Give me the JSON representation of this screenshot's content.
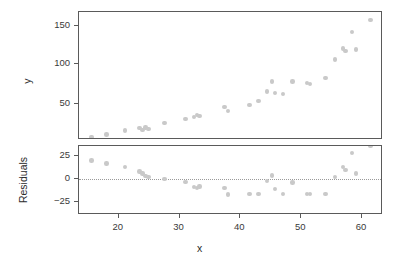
{
  "chart_data": [
    {
      "type": "scatter",
      "panel": "top",
      "title": "",
      "xlabel": "x",
      "ylabel": "y",
      "xlim": [
        14.0,
        63.5
      ],
      "ylim": [
        0,
        168
      ],
      "xticks": [
        20,
        30,
        40,
        50,
        60
      ],
      "xticklabels": [
        "20",
        "30",
        "40",
        "50",
        "60"
      ],
      "yticks": [
        50,
        100,
        150
      ],
      "yticklabels": [
        "50",
        "100",
        "150"
      ],
      "grid": false,
      "legend": null,
      "marker": "filled-circle",
      "marker_color": "#c9c9c9",
      "x": [
        15.5,
        18.0,
        21.0,
        23.4,
        23.9,
        24.4,
        24.9,
        27.5,
        31.0,
        32.4,
        32.9,
        33.3,
        37.4,
        38.0,
        41.5,
        43.0,
        44.4,
        45.2,
        45.7,
        47.0,
        48.6,
        51.0,
        51.4,
        54.0,
        55.6,
        56.9,
        57.3,
        58.4,
        59.0,
        61.4
      ],
      "y": [
        8,
        11,
        16,
        19,
        17,
        20,
        18,
        26,
        31,
        33,
        36,
        35,
        46,
        41,
        49,
        54,
        66,
        79,
        64,
        63,
        79,
        77,
        76,
        83,
        107,
        121,
        118,
        142,
        120,
        158
      ]
    },
    {
      "type": "scatter",
      "panel": "residuals",
      "title": "",
      "xlabel": "x",
      "ylabel": "Residuals",
      "xlim": [
        14.0,
        63.5
      ],
      "ylim": [
        -32,
        40
      ],
      "xticks": [
        20,
        30,
        40,
        50,
        60
      ],
      "xticklabels": [
        "20",
        "30",
        "40",
        "50",
        "60"
      ],
      "yticks": [
        25,
        0,
        -25
      ],
      "yticklabels": [
        "25",
        "0",
        "−25"
      ],
      "grid": false,
      "reference_line": {
        "y": 0,
        "style": "dotted",
        "color": "#9a9a9a"
      },
      "legend": null,
      "marker": "filled-circle",
      "marker_color": "#c9c9c9",
      "x": [
        15.5,
        18.0,
        21.0,
        23.4,
        23.9,
        24.4,
        24.9,
        27.5,
        31.0,
        32.4,
        32.9,
        33.3,
        37.4,
        38.0,
        41.5,
        43.0,
        44.4,
        45.2,
        45.7,
        47.0,
        48.6,
        51.0,
        51.4,
        54.0,
        55.6,
        56.9,
        57.3,
        58.4,
        59.0,
        61.4
      ],
      "y": [
        20,
        17,
        13,
        8,
        6,
        3,
        2,
        0,
        -3,
        -9,
        -10,
        -8,
        -10,
        -17,
        -16,
        -16,
        -2,
        4,
        -11,
        -16,
        -4,
        -16,
        -16,
        -16,
        2,
        13,
        10,
        28,
        6,
        36
      ]
    }
  ],
  "axes": {
    "top": {
      "ylabel": "y",
      "yticklabels": [
        "150",
        "100",
        "50"
      ]
    },
    "residuals": {
      "ylabel": "Residuals",
      "yticklabels": [
        "25",
        "0",
        "−25"
      ]
    },
    "shared_x": {
      "label": "x",
      "ticklabels": [
        "20",
        "30",
        "40",
        "50",
        "60"
      ]
    }
  }
}
